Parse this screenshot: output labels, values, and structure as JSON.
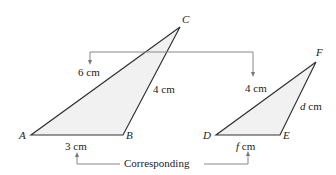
{
  "triangle_abc": {
    "vertices": {
      "A": "A",
      "B": "B",
      "C": "C"
    },
    "sides": {
      "AC": "6 cm",
      "BC": "4 cm",
      "AB": "3 cm"
    },
    "fill": "#f1f1f1",
    "stroke": "#333333"
  },
  "triangle_def": {
    "vertices": {
      "D": "D",
      "E": "E",
      "F": "F"
    },
    "sides": {
      "DF": "4 cm",
      "EF_var": "d",
      "EF_unit": " cm",
      "DE_var": "f",
      "DE_unit": " cm"
    },
    "fill": "#f1f1f1",
    "stroke": "#333333"
  },
  "annotation": {
    "label": "Corresponding",
    "arrow_color": "#888888"
  }
}
